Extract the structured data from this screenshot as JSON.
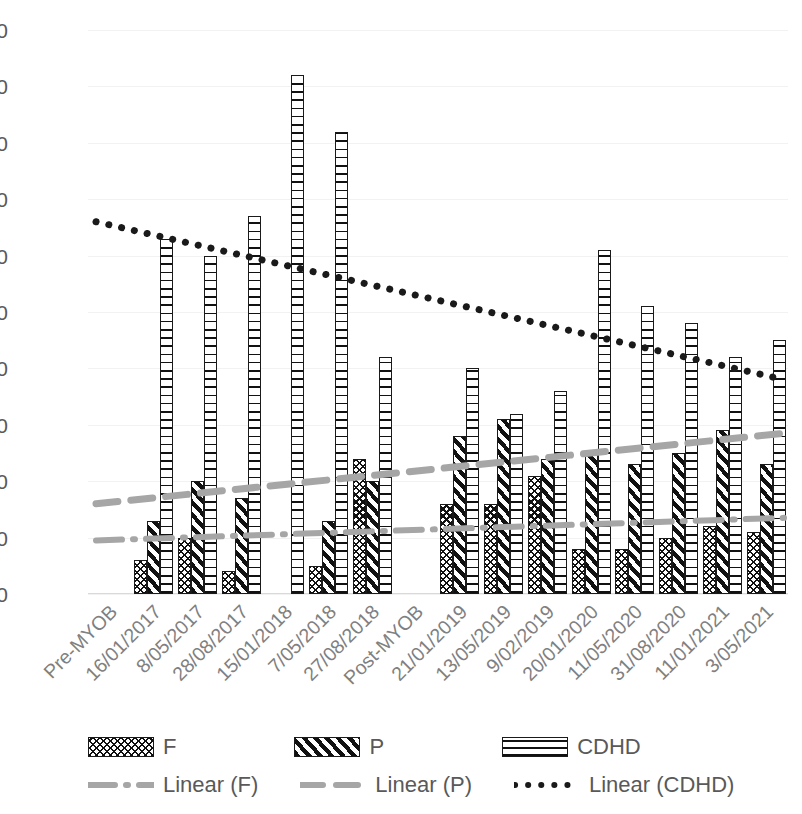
{
  "chart_data": {
    "type": "bar",
    "title": "",
    "xlabel": "",
    "ylabel": "",
    "ylim": [
      0,
      100
    ],
    "yticks": [
      100,
      90,
      80,
      70,
      60,
      50,
      40,
      30,
      20,
      10,
      0
    ],
    "grid": true,
    "legend_position": "bottom",
    "categories": [
      "Pre-MYOB",
      "16/01/2017",
      "8/05/2017",
      "28/08/2017",
      "15/01/2018",
      "7/05/2018",
      "27/08/2018",
      "Post-MYOB",
      "21/01/2019",
      "13/05/2019",
      "9/02/2019",
      "20/01/2020",
      "11/05/2020",
      "31/08/2020",
      "11/01/2021",
      "3/05/2021"
    ],
    "series": [
      {
        "name": "F",
        "values": [
          null,
          6,
          10,
          4,
          null,
          5,
          24,
          null,
          16,
          16,
          21,
          8,
          8,
          10,
          12,
          11
        ]
      },
      {
        "name": "P",
        "values": [
          null,
          13,
          20,
          17,
          null,
          13,
          20,
          null,
          28,
          31,
          24,
          25,
          23,
          25,
          29,
          23
        ]
      },
      {
        "name": "CDHD",
        "values": [
          null,
          63,
          60,
          67,
          92,
          82,
          42,
          null,
          40,
          32,
          36,
          61,
          51,
          48,
          42,
          45
        ]
      }
    ],
    "trendlines": [
      {
        "name": "Linear (F)",
        "style": "dash-dot",
        "color": "#a6a6a6",
        "y_start": 9.5,
        "y_end": 13.5
      },
      {
        "name": "Linear (P)",
        "style": "dashed",
        "color": "#a6a6a6",
        "y_start": 16.0,
        "y_end": 28.5
      },
      {
        "name": "Linear (CDHD)",
        "style": "dotted",
        "color": "#1a1a1a",
        "y_start": 66.0,
        "y_end": 38.0
      }
    ]
  },
  "legend": {
    "bars": [
      {
        "label": "F",
        "swatch": "crosshatch-pattern-swatch"
      },
      {
        "label": "P",
        "swatch": "diagonal-stripe-pattern-swatch"
      },
      {
        "label": "CDHD",
        "swatch": "horizontal-line-pattern-swatch"
      }
    ],
    "lines": [
      {
        "label": "Linear (F)",
        "swatch": "dash-dot-line-swatch"
      },
      {
        "label": "Linear (P)",
        "swatch": "dashed-line-swatch"
      },
      {
        "label": "Linear (CDHD)",
        "swatch": "dotted-line-swatch"
      }
    ]
  },
  "colors": {
    "bar_outline": "#1a1a1a",
    "gridline": "#f2f2f2",
    "tick_text": "#595959",
    "xlabel_text": "#808080",
    "trend_gray": "#a6a6a6",
    "trend_black": "#1a1a1a"
  }
}
